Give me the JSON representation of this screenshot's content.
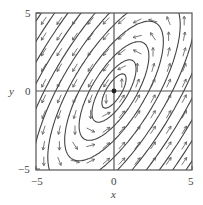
{
  "chart_data": {
    "type": "quiver",
    "title": "",
    "xlabel": "x",
    "ylabel": "y",
    "xlim": [
      -5.5,
      5.5
    ],
    "ylim": [
      -5.5,
      5.5
    ],
    "xticks": [
      "-5",
      "0",
      "5"
    ],
    "yticks": [
      "5",
      "0",
      "-5"
    ],
    "grid": false,
    "axes_through_origin": true,
    "equilibrium_point": [
      0,
      0
    ],
    "field": {
      "dx": "x - y",
      "dy": "2x - y"
    },
    "colors": {
      "arrows": "#555555",
      "trajectories": "#444444",
      "frame": "#555555"
    }
  },
  "labels": {
    "x_axis": "x",
    "y_axis": "y",
    "x_tick_min": "−5",
    "x_tick_zero": "0",
    "x_tick_max": "5",
    "y_tick_max": "5",
    "y_tick_zero": "0",
    "y_tick_min": "−5"
  }
}
